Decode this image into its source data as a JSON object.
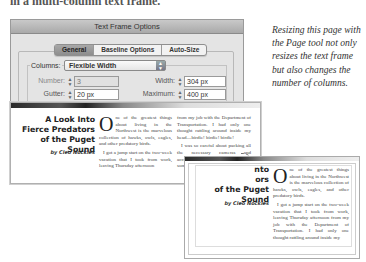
{
  "heading_cut": "in a multi-column text frame.",
  "dialog": {
    "title": "Text Frame Options",
    "tabs": [
      {
        "label": "General",
        "active": true
      },
      {
        "label": "Baseline Options",
        "active": false
      },
      {
        "label": "Auto-Size",
        "active": false
      }
    ],
    "columns_label": "Columns:",
    "columns_value": "Flexible Width",
    "number_label": "Number:",
    "number_value": "3",
    "width_label": "Width:",
    "width_value": "304 px",
    "gutter_label": "Gutter:",
    "gutter_value": "20 px",
    "maximum_label": "Maximum:",
    "maximum_value": "400 px"
  },
  "article": {
    "headline_lines": [
      "A Look Into",
      "Fierce Predators",
      "of the Puget Sound"
    ],
    "byline": "by Cleo Nockles",
    "dropcap": "O",
    "col1_p1": "ne of the greatest things about living in the Northwest is the marvelous collection of hawks, owls, eagles, and other predatory birds.",
    "col1_p2": "I got a jump start on the two-week vacation that I took from work, leaving Thursday afternoon",
    "col2_p1": "from my job with the Department of Transportation. I had only one thought rattling around inside my head—birdie! birdie! birdie!",
    "col2_p2": "I was so careful about packing all the necessary cameras and accessories that I very nearly forgot some other minor items, such as",
    "narrow_headline_fragments": [
      "nto",
      "ors"
    ],
    "narrow_headline_last": "of the Puget Sound",
    "narrow_col_p1": "ne of the greatest things about living in the Northwest is the marvelous collection of hawks, owls, eagles, and other predatory birds.",
    "narrow_col_p2": "I got a jump start on the two-week vacation that I took from work, leaving Thursday afternoon from my job with the Department of Transportation. I had only one thought rattling around inside my"
  },
  "caption": "Resizing this page with the Page tool not only resizes the text frame but also changes the number of columns.",
  "icons": {
    "drag_cursor": "▶"
  }
}
